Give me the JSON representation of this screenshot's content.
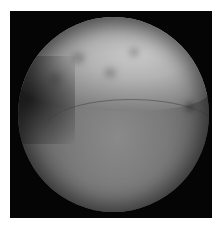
{
  "image": {
    "description": "Circular endoscopic grayscale view within black square frame",
    "background_color": "#ffffff",
    "frame_color": "#050505",
    "scope_shape": "circle",
    "regions": [
      {
        "name": "upper-bright-mucosa",
        "tone": "#c4c4c4"
      },
      {
        "name": "lower-smooth-surface",
        "tone": "#7e7e7e"
      },
      {
        "name": "left-dark-shadow",
        "tone": "#1e1e1e"
      }
    ]
  }
}
